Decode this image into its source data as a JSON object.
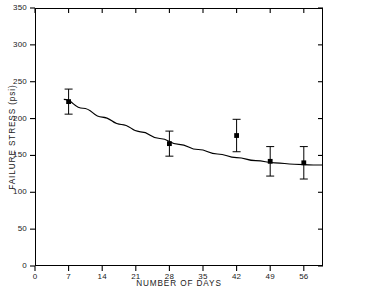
{
  "chart_data": {
    "type": "scatter",
    "title": "",
    "xlabel": "NUMBER OF DAYS",
    "ylabel": "FAILURE STRESS (psi)",
    "xlim": [
      0,
      60
    ],
    "ylim": [
      0,
      350
    ],
    "xticks": [
      0,
      7,
      14,
      21,
      28,
      35,
      42,
      49,
      56
    ],
    "xtick_labels": [
      "0",
      "7",
      "14",
      "21",
      "28",
      "35",
      "42",
      "49",
      "56"
    ],
    "yticks": [
      0,
      50,
      100,
      150,
      200,
      250,
      300,
      350
    ],
    "ytick_labels": [
      "0",
      "50",
      "100",
      "150",
      "200",
      "250",
      "300",
      "350"
    ],
    "grid": false,
    "legend": false,
    "frame": "box",
    "tick_direction": "out-left-bottom-in-top-right",
    "marker": "filled-square",
    "color": "#000000",
    "x": [
      7,
      28,
      42,
      49,
      56
    ],
    "values": [
      223,
      166,
      177,
      142,
      140
    ],
    "yerr": [
      17,
      17,
      22,
      20,
      22
    ],
    "points": [
      {
        "x": 7,
        "y": 223,
        "err": 17,
        "label": "7 days"
      },
      {
        "x": 28,
        "y": 166,
        "err": 17,
        "label": "28 days"
      },
      {
        "x": 42,
        "y": 177,
        "err": 22,
        "label": "42 days"
      },
      {
        "x": 49,
        "y": 142,
        "err": 20,
        "label": "49 days"
      },
      {
        "x": 56,
        "y": 140,
        "err": 22,
        "label": "56 days"
      }
    ],
    "fit_curve": {
      "name": "fitted trend",
      "x": [
        6,
        10,
        14,
        18,
        22,
        26,
        30,
        34,
        38,
        42,
        46,
        50,
        54,
        58,
        60
      ],
      "y": [
        226,
        214,
        202,
        192,
        182,
        173,
        165,
        158,
        152,
        147,
        143,
        140,
        138,
        137,
        137
      ]
    }
  }
}
